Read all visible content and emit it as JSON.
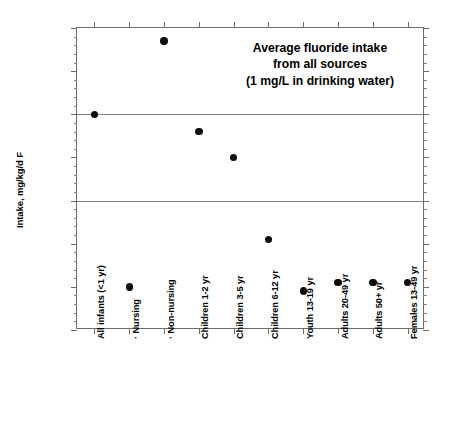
{
  "chart_data": {
    "type": "scatter",
    "title_lines": [
      "Average fluoride intake",
      "from all sources",
      "(1 mg/L in drinking water)"
    ],
    "xlabel": "",
    "ylabel": "Intake, mg/kg/d F",
    "ylim": [
      0.02,
      0.09
    ],
    "ytick_labels": [
      "0.09",
      "0.08",
      "0.07",
      "0.06",
      "0.05",
      "0.04",
      "0.03",
      "0.02"
    ],
    "ytick_values": [
      0.09,
      0.08,
      0.07,
      0.06,
      0.05,
      0.04,
      0.03,
      0.02
    ],
    "yminor_step": 0.002,
    "grid": "horizontal gridlines at 0.07 and 0.05",
    "gridlines": [
      0.07,
      0.05
    ],
    "legend": "none",
    "marker": "filled circle",
    "marker_color": "#0d0d0d",
    "categories": [
      "All infants (<1 yr)",
      "· Nursing",
      "· Non-nursing",
      "Children 1-2 yr",
      "Children 3-5 yr",
      "Children 6-12 yr",
      "Youth 13-19 yr",
      "Adults 20-49 yr",
      "Adults 50+ yr",
      "Females 13-49 yr"
    ],
    "values": [
      0.07,
      0.03,
      0.087,
      0.066,
      0.06,
      0.041,
      0.029,
      0.031,
      0.031,
      0.031
    ],
    "points": [
      {
        "category": "All infants (<1 yr)",
        "value": 0.07
      },
      {
        "category": "· Nursing",
        "value": 0.03
      },
      {
        "category": "· Non-nursing",
        "value": 0.087
      },
      {
        "category": "Children 1-2 yr",
        "value": 0.066
      },
      {
        "category": "Children 3-5 yr",
        "value": 0.06
      },
      {
        "category": "Children 6-12 yr",
        "value": 0.041
      },
      {
        "category": "Youth 13-19 yr",
        "value": 0.029
      },
      {
        "category": "Adults 20-49 yr",
        "value": 0.031
      },
      {
        "category": "Adults 50+ yr",
        "value": 0.031
      },
      {
        "category": "Females 13-49 yr",
        "value": 0.031
      }
    ]
  },
  "axis": {
    "frame_color": "#6b6b6b",
    "grid_color": "#808080"
  }
}
